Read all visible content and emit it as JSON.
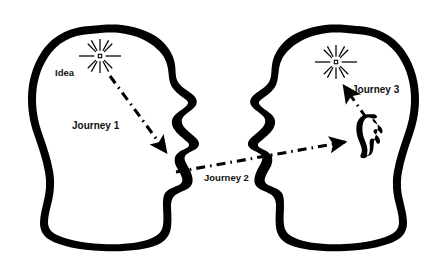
{
  "diagram": {
    "background_color": "#ffffff",
    "ink_color": "#000000",
    "labels": {
      "idea": "Idea",
      "journey1": "Journey 1",
      "journey2": "Journey 2",
      "journey3": "Journey 3"
    },
    "figures": [
      {
        "name": "speaker-head",
        "side": "left",
        "facing": "right",
        "contains": [
          "idea-starburst",
          "idea-label",
          "journey1-arrow",
          "journey1-label",
          "mouth"
        ]
      },
      {
        "name": "listener-head",
        "side": "right",
        "facing": "left",
        "contains": [
          "understanding-starburst",
          "journey3-arrow",
          "journey3-label",
          "ear"
        ]
      }
    ],
    "connectors": [
      {
        "name": "journey1-arrow",
        "label": "Journey 1",
        "style": "dash-dot",
        "from": "idea-starburst",
        "to": "speaker-mouth",
        "arrowhead": "end"
      },
      {
        "name": "journey2-arrow",
        "label": "Journey 2",
        "style": "dash-dot",
        "from": "speaker-mouth",
        "to": "listener-ear",
        "arrowhead": "end"
      },
      {
        "name": "journey3-arrow",
        "label": "Journey 3",
        "style": "dash-dot",
        "from": "listener-ear",
        "to": "understanding-starburst",
        "arrowhead": "end"
      }
    ],
    "icons": {
      "starburst_rays": 12,
      "ear": "ear-icon",
      "idea_symbol": "starburst-icon"
    }
  }
}
